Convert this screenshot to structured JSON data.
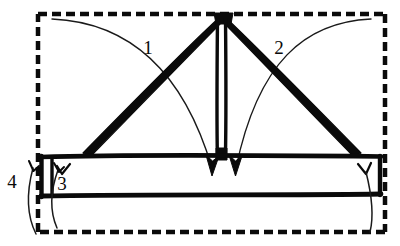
{
  "diagram": {
    "colors": {
      "ink": "#0a0a0a",
      "background": "#ffffff"
    },
    "labels": [
      {
        "id": "callout-1",
        "text": "1",
        "x": 148,
        "y": 54
      },
      {
        "id": "callout-2",
        "text": "2",
        "x": 279,
        "y": 54
      },
      {
        "id": "callout-3",
        "text": "3",
        "x": 62,
        "y": 190
      },
      {
        "id": "callout-4",
        "text": "4",
        "x": 12,
        "y": 188
      }
    ],
    "parts": {
      "outer_boundary": "dashed-rectangle",
      "apex_node": "peak",
      "left_brace": "diagonal-strut-left",
      "right_brace": "diagonal-strut-right",
      "king_post": "vertical-post",
      "beam": "horizontal-beam",
      "end_marks": "v-tick-marks"
    }
  }
}
